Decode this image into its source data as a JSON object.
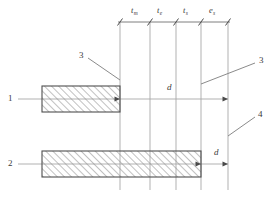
{
  "diagram": {
    "colors": {
      "line": "#9a9a9a",
      "outline": "#5a5a5a",
      "hatch": "#8c8c8c",
      "text": "#3a3a3a",
      "background": "#ffffff"
    },
    "dimension_labels": [
      {
        "id": "t-m",
        "base": "t",
        "sub": "m",
        "x": 135,
        "y": 11
      },
      {
        "id": "t-e",
        "base": "t",
        "sub": "e",
        "x": 160,
        "y": 11
      },
      {
        "id": "t-s",
        "base": "t",
        "sub": "s",
        "x": 186,
        "y": 11
      },
      {
        "id": "e-s",
        "base": "e",
        "sub": "s",
        "x": 212,
        "y": 11
      }
    ],
    "row_labels": [
      {
        "id": "row-1",
        "text": "1",
        "x": 8,
        "y": 94
      },
      {
        "id": "row-2",
        "text": "2",
        "x": 8,
        "y": 159
      }
    ],
    "callouts": [
      {
        "id": "callout-3-left",
        "text": "3",
        "x": 79,
        "y": 57
      },
      {
        "id": "callout-3-right",
        "text": "3",
        "x": 259,
        "y": 62
      },
      {
        "id": "callout-4",
        "text": "4",
        "x": 258,
        "y": 115
      }
    ],
    "d_labels": [
      {
        "id": "d-upper",
        "text": "d",
        "x": 167,
        "y": 88
      },
      {
        "id": "d-lower",
        "text": "d",
        "x": 214,
        "y": 153
      }
    ],
    "vertical_lines_x": [
      120,
      150,
      176,
      201,
      228
    ],
    "dimension_line_y": 22,
    "row_axis_y": [
      99,
      164
    ],
    "bars": [
      {
        "id": "bar-1",
        "x": 42,
        "y": 86,
        "width": 78,
        "height": 26
      },
      {
        "id": "bar-2",
        "x": 42,
        "y": 151,
        "width": 159,
        "height": 26
      }
    ]
  }
}
